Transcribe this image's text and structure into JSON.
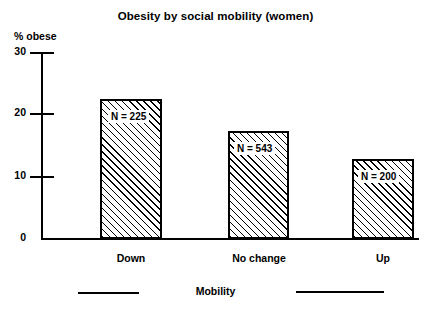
{
  "chart_data": {
    "type": "bar",
    "title": "Obesity by social mobility (women)",
    "xlabel": "Mobility",
    "ylabel": "% obese",
    "categories": [
      "Down",
      "No change",
      "Up"
    ],
    "values": [
      22.5,
      17.3,
      12.8
    ],
    "point_labels": [
      "N = 225",
      "N = 543",
      "N = 200"
    ],
    "ylim": [
      0,
      30
    ],
    "yticks": [
      0,
      10,
      20,
      30
    ],
    "ytick_labels": [
      "0",
      "10",
      "20",
      "30"
    ],
    "grid": false,
    "legend": "none",
    "bar_fill": "diagonal-hatch",
    "colors": {
      "bar_edge": "#000000",
      "bar_hatch": "#000000",
      "bar_face": "#ffffff",
      "axis": "#000000",
      "text": "#000000",
      "background": "#ffffff"
    },
    "annotations": [
      {
        "name": "left-rule",
        "kind": "horizontal-line"
      },
      {
        "name": "right-rule",
        "kind": "horizontal-line"
      }
    ]
  }
}
